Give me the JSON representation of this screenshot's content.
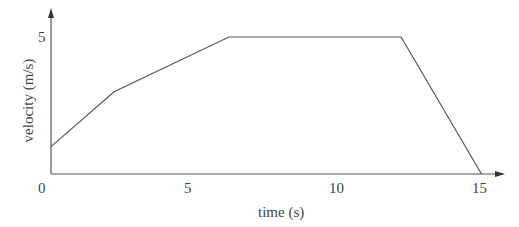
{
  "chart_data": {
    "type": "line",
    "title": "",
    "xlabel": "time (s)",
    "ylabel": "velocity (m/s)",
    "x_ticks": [
      "0",
      "5",
      "10",
      "15"
    ],
    "y_ticks": [
      "5"
    ],
    "xlim": [
      0,
      16
    ],
    "ylim": [
      0,
      5.5
    ],
    "grid": false,
    "legend": null,
    "series": [
      {
        "name": "velocity",
        "x": [
          0,
          2.2,
          6.2,
          12.2,
          15
        ],
        "y": [
          1,
          3,
          5,
          5,
          0
        ]
      }
    ],
    "line_color": "#555555"
  },
  "labels": {
    "origin": "0",
    "x5": "5",
    "x10": "10",
    "x15": "15",
    "y5": "5",
    "xaxis": "time (s)",
    "yaxis": "velocity (m/s)"
  }
}
